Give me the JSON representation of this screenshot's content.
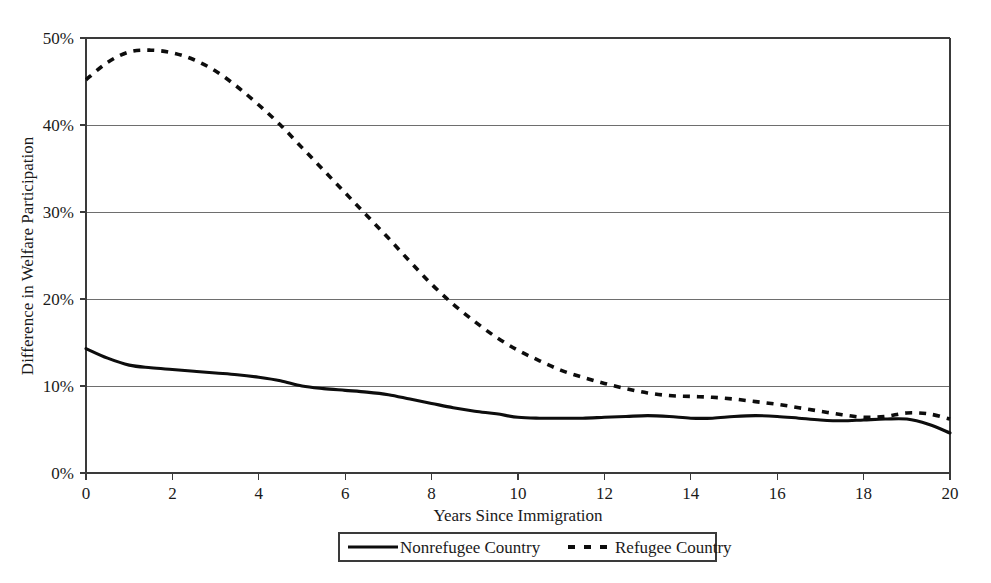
{
  "chart_data": {
    "type": "line",
    "title": "",
    "subtitle": "",
    "xlabel": "Years Since Immigration",
    "ylabel": "Difference in Welfare Participation",
    "xlim": [
      0,
      20
    ],
    "ylim": [
      0,
      0.5
    ],
    "grid": "horizontal",
    "legend_position": "bottom",
    "x_tick_labels": [
      "0",
      "2",
      "4",
      "6",
      "8",
      "10",
      "12",
      "14",
      "16",
      "18",
      "20"
    ],
    "x_ticks": [
      0,
      2,
      4,
      6,
      8,
      10,
      12,
      14,
      16,
      18,
      20
    ],
    "y_tick_labels": [
      "0%",
      "10%",
      "20%",
      "30%",
      "40%",
      "50%"
    ],
    "y_ticks": [
      0,
      10,
      20,
      30,
      40,
      50
    ],
    "x": [
      0,
      0.5,
      1,
      1.5,
      2,
      2.5,
      3,
      3.5,
      4,
      4.5,
      5,
      5.5,
      6,
      6.5,
      7,
      7.5,
      8,
      8.5,
      9,
      9.5,
      10,
      10.5,
      11,
      11.5,
      12,
      12.5,
      13,
      13.5,
      14,
      14.5,
      15,
      15.5,
      16,
      16.5,
      17,
      17.5,
      18,
      18.5,
      19,
      19.5,
      20
    ],
    "series": [
      {
        "name": "Nonrefugee Country",
        "style": "solid",
        "color": "#0d0d0d",
        "values": [
          14.3,
          13.2,
          12.4,
          12.1,
          11.9,
          11.7,
          11.5,
          11.3,
          11.0,
          10.6,
          10.0,
          9.7,
          9.5,
          9.3,
          9.0,
          8.5,
          8.0,
          7.5,
          7.1,
          6.8,
          6.4,
          6.3,
          6.3,
          6.3,
          6.4,
          6.5,
          6.6,
          6.5,
          6.3,
          6.3,
          6.5,
          6.6,
          6.5,
          6.3,
          6.1,
          6.0,
          6.1,
          6.2,
          6.2,
          5.6,
          4.6
        ]
      },
      {
        "name": "Refugee Country",
        "style": "dashed",
        "color": "#0d0d0d",
        "values": [
          45.2,
          47.2,
          48.4,
          48.6,
          48.3,
          47.5,
          46.2,
          44.4,
          42.3,
          40.0,
          37.4,
          34.8,
          32.2,
          29.6,
          27.0,
          24.3,
          21.7,
          19.4,
          17.4,
          15.6,
          14.1,
          12.9,
          11.8,
          11.0,
          10.3,
          9.7,
          9.2,
          8.9,
          8.8,
          8.7,
          8.5,
          8.2,
          7.9,
          7.5,
          7.1,
          6.7,
          6.4,
          6.5,
          6.9,
          6.8,
          6.2
        ]
      }
    ],
    "annotations": []
  },
  "legend": {
    "items": [
      {
        "label": "Nonrefugee Country",
        "style": "solid"
      },
      {
        "label": "Refugee Country",
        "style": "dashed"
      }
    ]
  }
}
